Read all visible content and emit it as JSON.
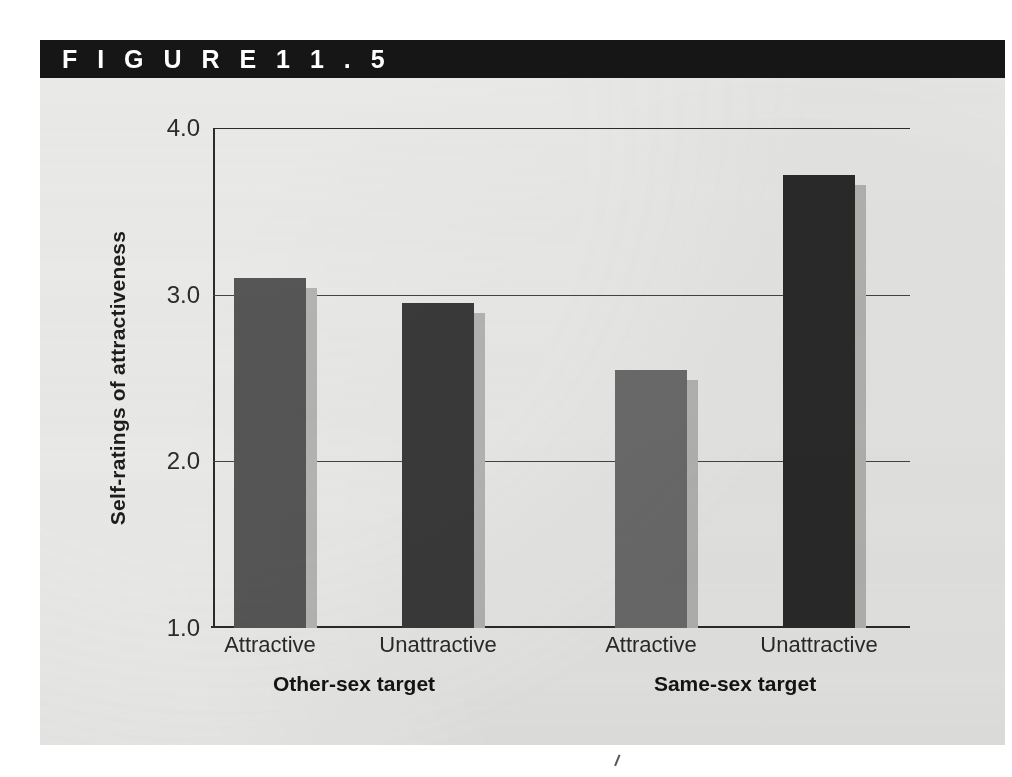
{
  "figure": {
    "header_label": "F I G U R E   1 1 . 5",
    "header_bg": "#161616",
    "panel_bg": "#e9e9e7"
  },
  "chart_data": {
    "type": "bar",
    "title": "",
    "xlabel": "",
    "ylabel": "Self-ratings of attractiveness",
    "ylim": [
      1.0,
      4.0
    ],
    "y_ticks": [
      "1.0",
      "2.0",
      "3.0",
      "4.0"
    ],
    "y_tick_values": [
      1.0,
      2.0,
      3.0,
      4.0
    ],
    "grid": true,
    "legend": "none",
    "groups": [
      {
        "label": "Other-sex target",
        "categories": [
          "Attractive",
          "Unattractive"
        ],
        "values": [
          3.1,
          2.95
        ],
        "colors": [
          "#565656",
          "#3a3a3a"
        ]
      },
      {
        "label": "Same-sex target",
        "categories": [
          "Attractive",
          "Unattractive"
        ],
        "values": [
          2.55,
          3.72
        ],
        "colors": [
          "#6b6b6b",
          "#2a2a2a"
        ]
      }
    ],
    "categories": [
      "Attractive",
      "Unattractive",
      "Attractive",
      "Unattractive"
    ],
    "values": [
      3.1,
      2.95,
      2.55,
      3.72
    ],
    "bar_colors": [
      "#565656",
      "#3a3a3a",
      "#6b6b6b",
      "#2a2a2a"
    ]
  }
}
